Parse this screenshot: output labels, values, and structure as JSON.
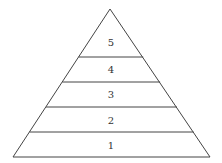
{
  "diagram": {
    "type": "pyramid",
    "levels": [
      {
        "label": "5",
        "position": "top"
      },
      {
        "label": "4"
      },
      {
        "label": "3"
      },
      {
        "label": "2"
      },
      {
        "label": "1",
        "position": "bottom"
      }
    ],
    "stroke_color": "#444444",
    "fill_color": "#ffffff"
  }
}
